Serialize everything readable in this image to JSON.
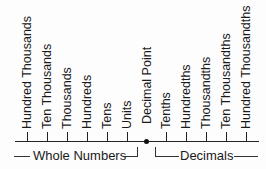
{
  "diagram": {
    "place_values": [
      {
        "label": "Hundred Thousands"
      },
      {
        "label": "Ten Thousands"
      },
      {
        "label": "Thousands"
      },
      {
        "label": "Hundreds"
      },
      {
        "label": "Tens"
      },
      {
        "label": "Units"
      },
      {
        "label": "Decimal Point"
      },
      {
        "label": "Tenths"
      },
      {
        "label": "Hundredths"
      },
      {
        "label": "Thousandths"
      },
      {
        "label": "Ten Thousandths"
      },
      {
        "label": "Hundred Thousandths"
      }
    ],
    "groups": {
      "whole": "Whole Numbers",
      "decimal": "Decimals"
    }
  }
}
